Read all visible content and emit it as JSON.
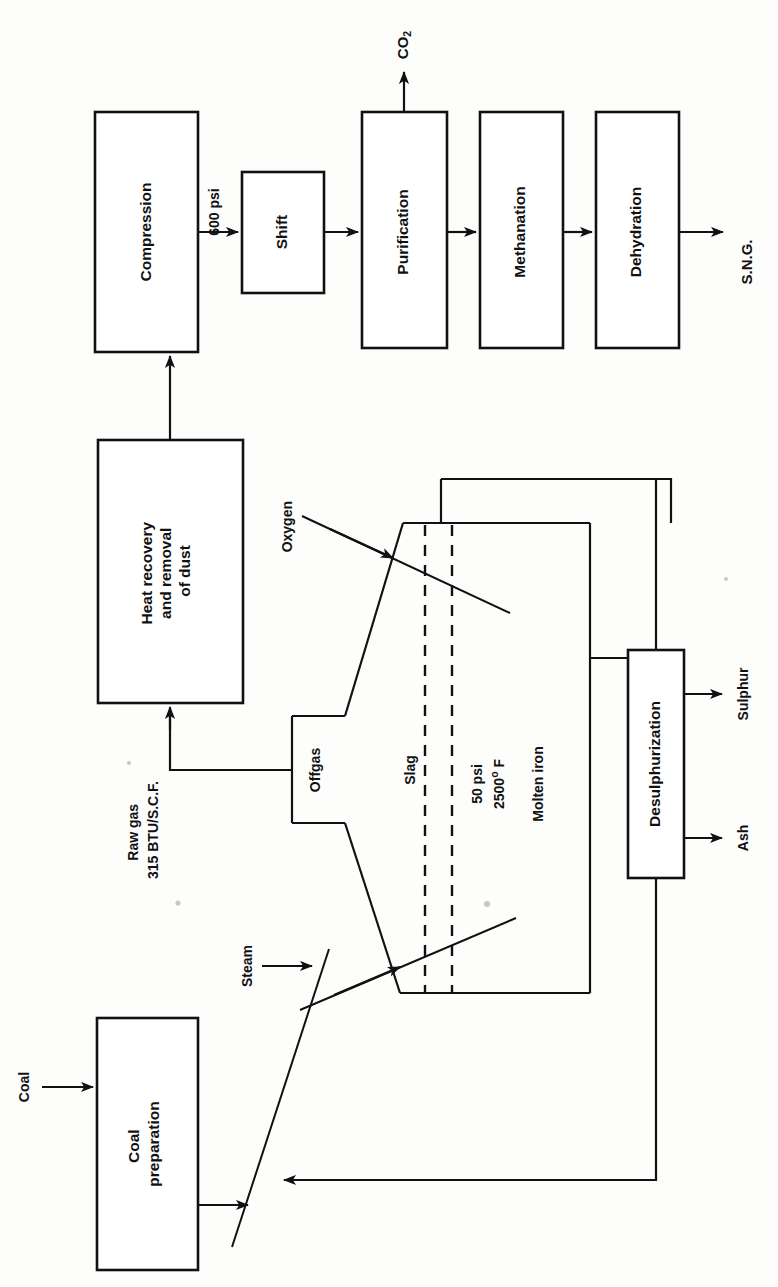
{
  "diagram": {
    "orientation": "rotated-90-ccw",
    "line_color": "#111111",
    "background_color": "#fdfdfb",
    "process_boxes": [
      {
        "id": "coal-preparation",
        "label": "Coal\npreparation",
        "line1": "Coal",
        "line2": "preparation"
      },
      {
        "id": "heat-recovery",
        "label": "Heat recovery and removal of dust",
        "line1": "Heat recovery",
        "line2": "and removal",
        "line3": "of dust"
      },
      {
        "id": "compression",
        "label": "Compression"
      },
      {
        "id": "shift",
        "label": "Shift"
      },
      {
        "id": "purification",
        "label": "Purification"
      },
      {
        "id": "methanation",
        "label": "Methanation"
      },
      {
        "id": "dehydration",
        "label": "Dehydration"
      },
      {
        "id": "desulphurization",
        "label": "Desulphurization"
      }
    ],
    "stream_labels": [
      {
        "id": "coal-in",
        "label": "Coal"
      },
      {
        "id": "steam-in",
        "label": "Steam"
      },
      {
        "id": "oxygen-in",
        "label": "Oxygen"
      },
      {
        "id": "offgas",
        "label": "Offgas"
      },
      {
        "id": "slag",
        "label": "Slag"
      },
      {
        "id": "molten-iron",
        "label": "Molten iron"
      },
      {
        "id": "ash-out",
        "label": "Ash"
      },
      {
        "id": "sulphur-out",
        "label": "Sulphur"
      },
      {
        "id": "sng-out",
        "label": "S.N.G."
      }
    ],
    "annotations": {
      "raw_gas_line1": "Raw gas",
      "raw_gas_line2": "315 BTU/S.C.F.",
      "pressure_600": "600 psi",
      "vessel_pressure": "50 psi",
      "vessel_temperature_value": "2500",
      "vessel_temperature_unit": "F",
      "vessel_temperature_degree": "o",
      "co2_label_base": "CO",
      "co2_label_sub": "2"
    }
  }
}
